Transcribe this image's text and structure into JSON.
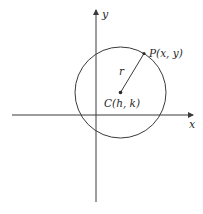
{
  "diagram": {
    "axes": {
      "x_label": "x",
      "y_label": "y"
    },
    "circle": {
      "center_label": "C(h, k)",
      "point_label": "P(x, y)",
      "radius_label": "r"
    },
    "colors": {
      "stroke": "#3a3a3a",
      "text": "#2a2a2a",
      "background": "#ffffff"
    }
  }
}
